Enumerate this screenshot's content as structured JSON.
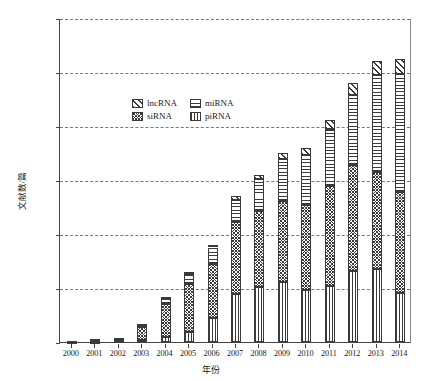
{
  "chart_data": {
    "type": "bar",
    "subtype": "stacked-bar",
    "title": "",
    "xlabel": "年份",
    "ylabel": "文献数/篇",
    "ylim": [
      0,
      30000
    ],
    "ytick_labels": [
      "0",
      "5 000",
      "10 000",
      "15 000",
      "20 000",
      "25 000",
      "30 000"
    ],
    "ytick_values": [
      0,
      5000,
      10000,
      15000,
      20000,
      25000,
      30000
    ],
    "grid": "horizontal-dashed",
    "legend_position": "upper-left-inside",
    "stack_order_bottom_to_top": [
      "piRNA",
      "siRNA",
      "miRNA",
      "lncRNA"
    ],
    "categories": [
      "2000",
      "2001",
      "2002",
      "2003",
      "2004",
      "2005",
      "2006",
      "2007",
      "2008",
      "2009",
      "2010",
      "2011",
      "2012",
      "2013",
      "2014"
    ],
    "series": [
      {
        "name": "lncRNA",
        "pattern": "diagonal-hatch",
        "values": [
          0,
          10,
          20,
          60,
          110,
          170,
          250,
          330,
          430,
          560,
          700,
          900,
          1100,
          1250,
          1350
        ]
      },
      {
        "name": "miRNA",
        "pattern": "horizontal-lines",
        "values": [
          30,
          60,
          90,
          220,
          600,
          1000,
          1500,
          2100,
          2900,
          3900,
          4600,
          5300,
          6500,
          9000,
          11000
        ]
      },
      {
        "name": "siRNA",
        "pattern": "dense-cross-hatch",
        "values": [
          60,
          140,
          230,
          1200,
          3000,
          4400,
          5000,
          6600,
          7100,
          7500,
          7900,
          9200,
          9800,
          9000,
          9300
        ]
      },
      {
        "name": "piRNA",
        "pattern": "vertical-lines",
        "values": [
          10,
          40,
          60,
          220,
          500,
          930,
          2250,
          4470,
          5070,
          5540,
          4800,
          5200,
          6600,
          6750,
          4550
        ]
      }
    ],
    "totals": [
      100,
      250,
      400,
      1700,
      4210,
      6500,
      9000,
      13500,
      15500,
      17500,
      18000,
      20600,
      24000,
      26000,
      26200
    ]
  },
  "legend": {
    "items": [
      {
        "label": "lncRNA",
        "swatch": "diagonal-hatch-swatch"
      },
      {
        "label": "miRNA",
        "swatch": "horizontal-lines-swatch"
      },
      {
        "label": "siRNA",
        "swatch": "dense-cross-hatch-swatch"
      },
      {
        "label": "piRNA",
        "swatch": "vertical-lines-swatch"
      }
    ]
  },
  "colors": {
    "axis": "#444444",
    "grid": "#777777",
    "hatch": "#3a3a3a",
    "background": "#ffffff"
  }
}
